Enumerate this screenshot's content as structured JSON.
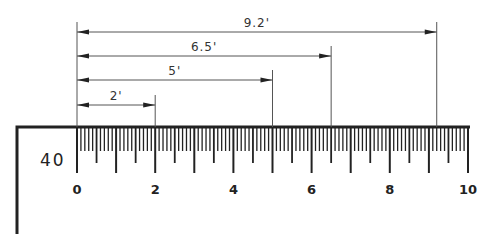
{
  "diagram": {
    "scale_label": "40",
    "scale": {
      "origin_x": 77,
      "unit_px": 39.1,
      "top_y": 127,
      "min": 0,
      "max": 10,
      "subdivisions": 10,
      "major_labels": [
        "0",
        "2",
        "4",
        "6",
        "8",
        "10"
      ]
    },
    "measurements": [
      {
        "label": "2'",
        "value": 2,
        "y": 105
      },
      {
        "label": "5'",
        "value": 5,
        "y": 80
      },
      {
        "label": "6.5'",
        "value": 6.5,
        "y": 56
      },
      {
        "label": "9.2'",
        "value": 9.2,
        "y": 32
      }
    ],
    "colors": {
      "line": "#222222",
      "dim_line": "#555555",
      "background": "#ffffff"
    }
  }
}
